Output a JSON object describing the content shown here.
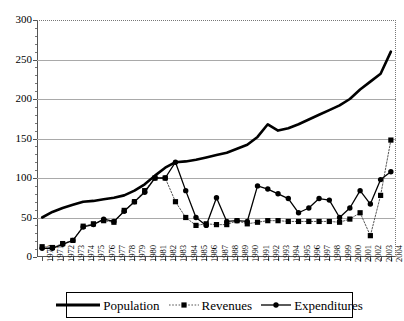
{
  "chart_data": {
    "type": "line",
    "title": "",
    "xlabel": "",
    "ylabel": "",
    "ylim": [
      0,
      300
    ],
    "ytick_values": [
      0,
      50,
      100,
      150,
      200,
      250,
      300
    ],
    "ytick_labels": [
      "0",
      "50",
      "100",
      "150",
      "200",
      "250",
      "300"
    ],
    "grid": true,
    "legend_position": "bottom",
    "x": [
      1970,
      1971,
      1972,
      1973,
      1974,
      1975,
      1976,
      1977,
      1978,
      1979,
      1980,
      1981,
      1982,
      1983,
      1984,
      1985,
      1986,
      1987,
      1988,
      1989,
      1990,
      1991,
      1992,
      1993,
      1994,
      1995,
      1996,
      1997,
      1998,
      1999,
      2000,
      2001,
      2002,
      2003,
      2004
    ],
    "categories": [
      "1970",
      "1971",
      "1972",
      "1973",
      "1974",
      "1975",
      "1976",
      "1977",
      "1978",
      "1979",
      "1980",
      "1981",
      "1982",
      "1983",
      "1984",
      "1985",
      "1986",
      "1987",
      "1988",
      "1989",
      "1990",
      "1991",
      "1992",
      "1993",
      "1994",
      "1995",
      "1996",
      "1997",
      "1998",
      "1999",
      "2000",
      "2001",
      "2002",
      "2003",
      "2004"
    ],
    "series": [
      {
        "name": "Population",
        "marker": "none",
        "line": "solid-thick",
        "values": [
          50,
          57,
          62,
          66,
          70,
          71,
          73,
          75,
          78,
          84,
          92,
          103,
          113,
          120,
          121,
          123,
          126,
          129,
          132,
          137,
          142,
          152,
          168,
          160,
          163,
          168,
          174,
          180,
          186,
          192,
          200,
          212,
          222,
          232,
          260
        ]
      },
      {
        "name": "Revenues",
        "marker": "square",
        "line": "dotted",
        "values": [
          13,
          12,
          17,
          21,
          39,
          42,
          46,
          44,
          59,
          70,
          84,
          100,
          100,
          70,
          50,
          40,
          42,
          41,
          41,
          46,
          42,
          44,
          46,
          46,
          45,
          45,
          45,
          45,
          45,
          44,
          48,
          56,
          27,
          78,
          148
        ]
      },
      {
        "name": "Expenditures",
        "marker": "circle",
        "line": "solid",
        "values": [
          11,
          11,
          16,
          21,
          38,
          41,
          48,
          45,
          58,
          70,
          82,
          100,
          100,
          120,
          84,
          50,
          40,
          75,
          45,
          46,
          45,
          90,
          86,
          80,
          74,
          56,
          62,
          74,
          72,
          50,
          62,
          84,
          67,
          98,
          108
        ]
      }
    ]
  },
  "legend": {
    "items": [
      {
        "label": "Population",
        "style": "solid-thick",
        "marker": "none"
      },
      {
        "label": "Revenues",
        "style": "dotted",
        "marker": "square"
      },
      {
        "label": "Expenditures",
        "style": "solid",
        "marker": "circle"
      }
    ]
  }
}
